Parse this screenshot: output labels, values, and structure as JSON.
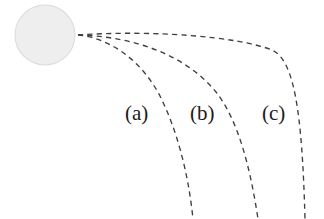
{
  "figure": {
    "background_color": "#ffffff",
    "ink_color": "#3f3f3f",
    "label_color": "#1b1b1b"
  },
  "central_body": {
    "name": "shaded-disc",
    "center_x": 45,
    "center_y": 35,
    "radius": 30,
    "fill_color": "#eeeeee",
    "stroke_color": "#dcdcdc"
  },
  "labels": [
    {
      "text": "(a)",
      "x": 125,
      "y": 120
    },
    {
      "text": "(b)",
      "x": 190,
      "y": 120
    },
    {
      "text": "(c)",
      "x": 262,
      "y": 120
    }
  ],
  "chart_data": {
    "type": "line",
    "title": "",
    "xlabel": "",
    "ylabel": "",
    "grid": false,
    "legend": "inline-annotations",
    "xlim": [
      0,
      324
    ],
    "ylim": [
      0,
      219
    ],
    "origin": {
      "x": 78,
      "y": 35
    },
    "series": [
      {
        "name": "(a)",
        "style": "dashed",
        "path": "M 78 35 C 108 38 140 58 160 96 C 176 128 188 170 193 219",
        "points": [
          [
            78,
            35
          ],
          [
            96,
            38
          ],
          [
            114,
            45
          ],
          [
            130,
            56
          ],
          [
            144,
            70
          ],
          [
            156,
            86
          ],
          [
            166,
            106
          ],
          [
            175,
            129
          ],
          [
            182,
            152
          ],
          [
            188,
            180
          ],
          [
            193,
            219
          ]
        ]
      },
      {
        "name": "(b)",
        "style": "dashed",
        "path": "M 78 35 C 120 36 180 48 216 92 C 238 120 250 166 258 219",
        "points": [
          [
            78,
            35
          ],
          [
            104,
            37
          ],
          [
            130,
            41
          ],
          [
            156,
            48
          ],
          [
            180,
            58
          ],
          [
            200,
            72
          ],
          [
            216,
            92
          ],
          [
            230,
            116
          ],
          [
            240,
            145
          ],
          [
            250,
            180
          ],
          [
            258,
            219
          ]
        ]
      },
      {
        "name": "(c)",
        "style": "dashed",
        "path": "M 78 35 C 150 30 236 36 272 50 C 294 60 302 110 305 219",
        "points": [
          [
            78,
            35
          ],
          [
            112,
            33
          ],
          [
            148,
            32
          ],
          [
            184,
            33
          ],
          [
            216,
            36
          ],
          [
            244,
            41
          ],
          [
            266,
            48
          ],
          [
            284,
            62
          ],
          [
            294,
            88
          ],
          [
            301,
            140
          ],
          [
            305,
            219
          ]
        ]
      }
    ]
  }
}
